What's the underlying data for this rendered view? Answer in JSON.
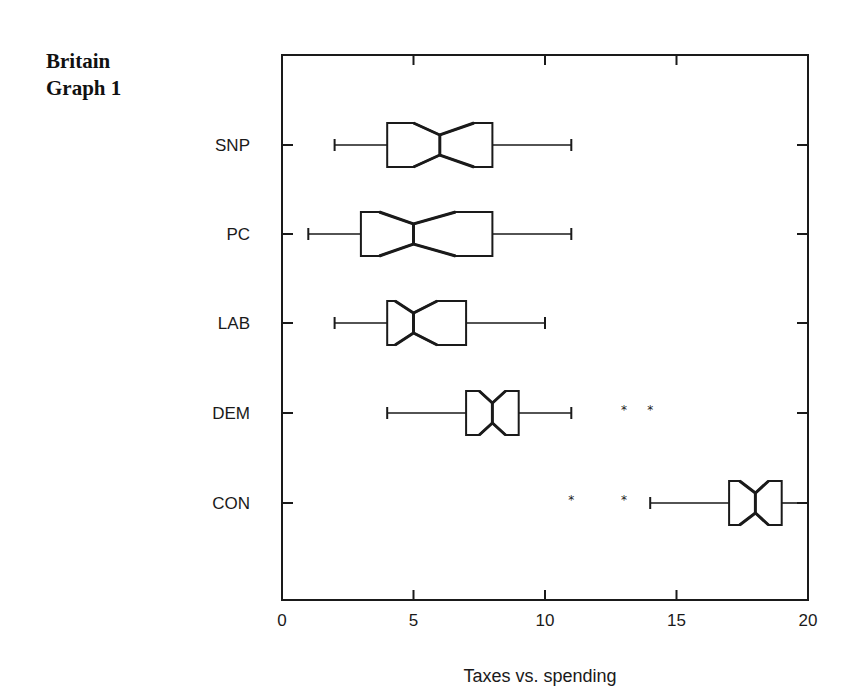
{
  "title": {
    "line1": "Britain",
    "line2": "Graph 1"
  },
  "chart_data": {
    "type": "boxplot",
    "orientation": "horizontal",
    "notched": true,
    "title": "Britain Graph 1",
    "xlabel": "Taxes vs. spending",
    "ylabel": "",
    "xlim": [
      0,
      20
    ],
    "xticks": [
      0,
      5,
      10,
      15,
      20
    ],
    "xtick_labels": [
      "0",
      "5",
      "10",
      "15",
      "20"
    ],
    "grid": false,
    "legend": null,
    "categories": [
      "SNP",
      "PC",
      "LAB",
      "DEM",
      "CON"
    ],
    "series": [
      {
        "name": "SNP",
        "whisker_low": 2,
        "q1": 4,
        "notch_low": 5.0,
        "median": 6,
        "notch_high": 7.3,
        "q3": 8,
        "whisker_high": 11,
        "outliers": []
      },
      {
        "name": "PC",
        "whisker_low": 1,
        "q1": 3,
        "notch_low": 3.7,
        "median": 5,
        "notch_high": 6.6,
        "q3": 8,
        "whisker_high": 11,
        "outliers": []
      },
      {
        "name": "LAB",
        "whisker_low": 2,
        "q1": 4,
        "notch_low": 4.3,
        "median": 5,
        "notch_high": 5.9,
        "q3": 7,
        "whisker_high": 10,
        "outliers": []
      },
      {
        "name": "DEM",
        "whisker_low": 4,
        "q1": 7,
        "notch_low": 7.5,
        "median": 8,
        "notch_high": 8.5,
        "q3": 9,
        "whisker_high": 11,
        "outliers": [
          13,
          14
        ]
      },
      {
        "name": "CON",
        "whisker_low": 14,
        "q1": 17,
        "notch_low": 17.4,
        "median": 18,
        "notch_high": 18.5,
        "q3": 19,
        "whisker_high": 20,
        "outliers": [
          11,
          13
        ]
      }
    ]
  },
  "style": {
    "line_color": "#1a1a1a",
    "background": "#ffffff"
  }
}
